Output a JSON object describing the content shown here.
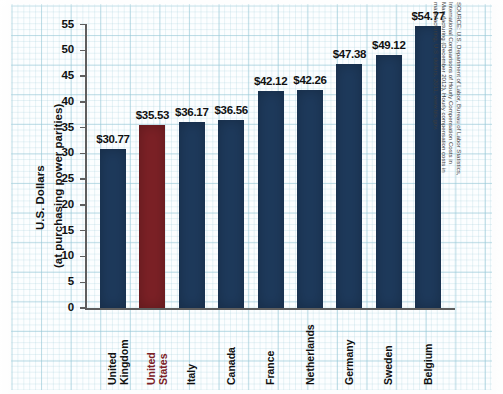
{
  "chart_data": {
    "type": "bar",
    "title": "",
    "xlabel": "",
    "ylabel": "U.S. Dollars (at purchasing power parities)",
    "ylabel_line1": "U.S. Dollars",
    "ylabel_line2": "(at purchasing power parities)",
    "ylim": [
      0,
      55
    ],
    "ytick_values": [
      0,
      5,
      10,
      15,
      20,
      25,
      30,
      35,
      40,
      45,
      50,
      55
    ],
    "ytick_labels": [
      "0",
      "5",
      "10",
      "15",
      "20",
      "25",
      "30",
      "35",
      "40",
      "45",
      "50",
      "55"
    ],
    "grid": true,
    "legend": "none",
    "categories": [
      "United Kingdom",
      "United States",
      "Italy",
      "Canada",
      "France",
      "Netherlands",
      "Germany",
      "Sweden",
      "Belgium"
    ],
    "values": [
      30.77,
      35.53,
      36.17,
      36.56,
      42.12,
      42.26,
      47.38,
      49.12,
      54.77
    ],
    "data_labels": [
      "$30.77",
      "$35.53",
      "$36.17",
      "$36.56",
      "$42.12",
      "$42.26",
      "$47.38",
      "$49.12",
      "$54.77"
    ],
    "bars": [
      {
        "category_line1": "United",
        "category_line2": "Kingdom",
        "value": 30.77,
        "label": "$30.77",
        "color": "#1e3a5c",
        "highlight": false
      },
      {
        "category_line1": "United",
        "category_line2": "States",
        "value": 35.53,
        "label": "$35.53",
        "color": "#7c2126",
        "highlight": true
      },
      {
        "category_line1": "Italy",
        "category_line2": "",
        "value": 36.17,
        "label": "$36.17",
        "color": "#1e3a5c",
        "highlight": false
      },
      {
        "category_line1": "Canada",
        "category_line2": "",
        "value": 36.56,
        "label": "$36.56",
        "color": "#1e3a5c",
        "highlight": false
      },
      {
        "category_line1": "France",
        "category_line2": "",
        "value": 42.12,
        "label": "$42.12",
        "color": "#1e3a5c",
        "highlight": false
      },
      {
        "category_line1": "Netherlands",
        "category_line2": "",
        "value": 42.26,
        "label": "$42.26",
        "color": "#1e3a5c",
        "highlight": false
      },
      {
        "category_line1": "Germany",
        "category_line2": "",
        "value": 47.38,
        "label": "$47.38",
        "color": "#1e3a5c",
        "highlight": false
      },
      {
        "category_line1": "Sweden",
        "category_line2": "",
        "value": 49.12,
        "label": "$49.12",
        "color": "#1e3a5c",
        "highlight": false
      },
      {
        "category_line1": "Belgium",
        "category_line2": "",
        "value": 54.77,
        "label": "$54.77",
        "color": "#1e3a5c",
        "highlight": false
      }
    ],
    "colors": {
      "bar_default": "#1e3a5c",
      "bar_highlight": "#7c2126",
      "grid_line": "#96c8d7",
      "axis": "#5e5e5e",
      "text": "#111111",
      "background": "#fcfeff"
    },
    "source_note": "SOURCE: U.S. Department of Labor, Bureau of Labor Statistics, International Comparisons of Hourly Compensation Costs in Manufacturing (December 2012), Hourly compensation costs in manufacturing, U.S. dollars, 2011, www.bls.gov."
  }
}
